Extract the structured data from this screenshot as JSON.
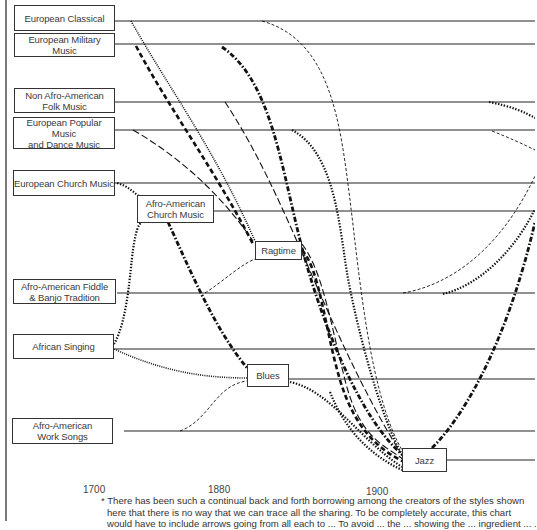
{
  "diagram": {
    "type": "influence-timeline",
    "source_styles": [
      {
        "id": "european_classical",
        "label": "European Classical"
      },
      {
        "id": "european_military",
        "label": "European Military Music"
      },
      {
        "id": "non_afro_folk",
        "label": "Non Afro-American\nFolk Music"
      },
      {
        "id": "european_popular",
        "label": "European Popular Music\nand Dance Music"
      },
      {
        "id": "european_church",
        "label": "European Church Music"
      },
      {
        "id": "afro_fiddle_banjo",
        "label": "Afro-American Fiddle\n& Banjo Tradition"
      },
      {
        "id": "african_singing",
        "label": "African Singing"
      },
      {
        "id": "afro_work_songs",
        "label": "Afro-American\nWork Songs"
      }
    ],
    "derived_styles": [
      {
        "id": "afro_church",
        "label": "Afro-American\nChurch Music"
      },
      {
        "id": "ragtime",
        "label": "Ragtime"
      },
      {
        "id": "blues",
        "label": "Blues"
      },
      {
        "id": "jazz",
        "label": "Jazz"
      }
    ],
    "influences": [
      {
        "from": "European Classical",
        "to": "Ragtime",
        "style": "fine-dotted"
      },
      {
        "from": "European Military Music",
        "to": "Ragtime",
        "style": "heavy-dashed"
      },
      {
        "from": "European Popular Music and Dance Music",
        "to": "Ragtime",
        "style": "long-dashed"
      },
      {
        "from": "European Church Music",
        "to": "Afro-American Church Music",
        "style": "dotted"
      },
      {
        "from": "African Singing",
        "to": "Afro-American Church Music",
        "style": "dotted"
      },
      {
        "from": "Afro-American Church Music",
        "to": "Blues",
        "style": "dash-dot-heavy"
      },
      {
        "from": "African Singing",
        "to": "Blues",
        "style": "fine-dotted"
      },
      {
        "from": "Afro-American Work Songs",
        "to": "Blues",
        "style": "thin-dashed"
      },
      {
        "from": "Afro-American Fiddle & Banjo Tradition",
        "to": "Ragtime",
        "style": "thin-dashed"
      },
      {
        "from": "European Classical",
        "to": "Jazz",
        "style": "thin-dashed"
      },
      {
        "from": "European Military Music",
        "to": "Jazz",
        "style": "dash-dot-heavy"
      },
      {
        "from": "Non Afro-American Folk Music",
        "to": "Jazz",
        "style": "long-dashed"
      },
      {
        "from": "European Popular Music and Dance Music",
        "to": "Jazz",
        "style": "dotted"
      },
      {
        "from": "Ragtime",
        "to": "Jazz",
        "style": "heavy-dashed"
      },
      {
        "from": "Blues",
        "to": "Jazz",
        "style": "dotted"
      },
      {
        "from": "Jazz",
        "to": "later styles",
        "style": "dash-dot-heavy"
      }
    ]
  },
  "boxes": {
    "european_classical": "European Classical",
    "european_military": "European Military Music",
    "non_afro_folk_1": "Non Afro-American",
    "non_afro_folk_2": "Folk Music",
    "european_popular_1": "European Popular Music",
    "european_popular_2": "and Dance Music",
    "european_church": "European Church Music",
    "afro_church_1": "Afro-American",
    "afro_church_2": "Church Music",
    "ragtime": "Ragtime",
    "afro_fiddle_1": "Afro-American Fiddle",
    "afro_fiddle_2": "& Banjo Tradition",
    "african_singing": "African Singing",
    "blues": "Blues",
    "afro_work_1": "Afro-American",
    "afro_work_2": "Work Songs",
    "jazz": "Jazz"
  },
  "axis": {
    "ticks": [
      "1700",
      "1880",
      "1900"
    ]
  },
  "footnote": {
    "line1": "* There has been such a continual back and forth borrowing among the creators of the styles shown",
    "line2": "here that there is no way that we can trace all the sharing. To be completely accurate, this chart",
    "line3": "would have to include arrows going from all each to ... To avoid ... the ... showing the ... ingredient ... ."
  }
}
